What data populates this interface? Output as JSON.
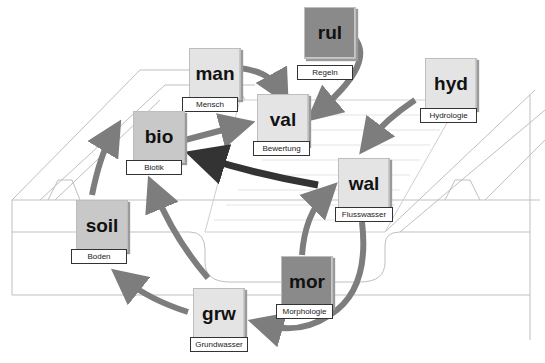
{
  "diagram": {
    "nodes": [
      {
        "id": "rul",
        "code": "rul",
        "label": "Regeln",
        "shade": "dark"
      },
      {
        "id": "man",
        "code": "man",
        "label": "Mensch",
        "shade": "light"
      },
      {
        "id": "val",
        "code": "val",
        "label": "Bewertung",
        "shade": "light"
      },
      {
        "id": "hyd",
        "code": "hyd",
        "label": "Hydrologie",
        "shade": "light"
      },
      {
        "id": "bio",
        "code": "bio",
        "label": "Biotik",
        "shade": "mid"
      },
      {
        "id": "wal",
        "code": "wal",
        "label": "Flusswasser",
        "shade": "light"
      },
      {
        "id": "soil",
        "code": "soil",
        "label": "Boden",
        "shade": "mid"
      },
      {
        "id": "mor",
        "code": "mor",
        "label": "Morphologie",
        "shade": "dark"
      },
      {
        "id": "grw",
        "code": "grw",
        "label": "Grundwasser",
        "shade": "light"
      }
    ],
    "edges": [
      {
        "from": "man",
        "to": "val"
      },
      {
        "from": "rul",
        "to": "val"
      },
      {
        "from": "bio",
        "to": "val"
      },
      {
        "from": "hyd",
        "to": "wal"
      },
      {
        "from": "wal",
        "to": "bio",
        "emphasis": "dark"
      },
      {
        "from": "soil",
        "to": "bio"
      },
      {
        "from": "grw",
        "to": "bio"
      },
      {
        "from": "grw",
        "to": "soil"
      },
      {
        "from": "mor",
        "to": "wal"
      },
      {
        "from": "wal",
        "to": "grw"
      }
    ],
    "colors": {
      "arrow": "#7d7d7d",
      "arrow_dark": "#333333",
      "node_light": "#e4e4e4",
      "node_mid": "#c8c8c8",
      "node_dark": "#8a8a8a"
    }
  }
}
